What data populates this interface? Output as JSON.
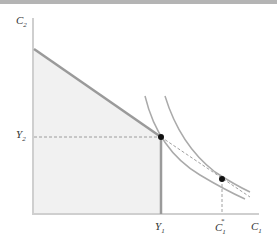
{
  "diagram": {
    "axes": {
      "y_label": "C",
      "y_label_sub": "2",
      "x_label": "C",
      "x_label_sub": "1"
    },
    "ticks": {
      "y2": {
        "label": "Y",
        "sub": "2"
      },
      "y1": {
        "label": "Y",
        "sub": "1"
      },
      "c1star": {
        "label": "C",
        "sub": "1",
        "sup": "*"
      }
    },
    "elements": [
      "budget-line-upper-segment",
      "shaded-feasible-region",
      "vertical-constraint-at-Y1",
      "dashed-budget-extension",
      "indifference-curve-lower",
      "indifference-curve-higher",
      "endowment-point",
      "optimal-point"
    ],
    "colors": {
      "axis": "#c8c8c8",
      "budget": "#999999",
      "shade": "#f0f0f0",
      "curve": "#a8a8a8",
      "point": "#111111"
    }
  }
}
